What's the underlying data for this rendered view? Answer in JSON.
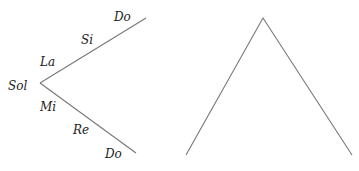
{
  "left_diagram": {
    "labels": {
      "vertex": "Sol",
      "upper": [
        "La",
        "Si",
        "Do"
      ],
      "lower": [
        "Mi",
        "Re",
        "Do"
      ]
    },
    "vertex": [
      40,
      83
    ],
    "upper_end": [
      146,
      18
    ],
    "lower_end": [
      136,
      153
    ]
  },
  "right_diagram": {
    "shape": "inverted-V",
    "apex": [
      263,
      18
    ],
    "left_base": [
      186,
      155
    ],
    "right_base": [
      352,
      155
    ]
  },
  "colors": {
    "line": "#777777",
    "text": "#222222"
  }
}
